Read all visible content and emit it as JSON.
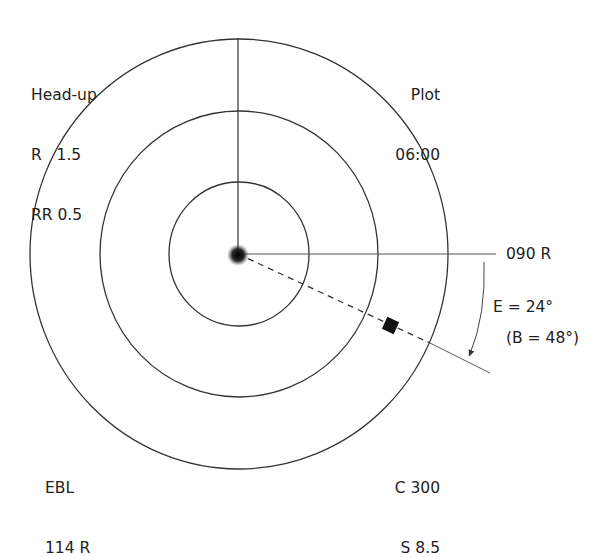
{
  "diagram": {
    "type": "radar-display",
    "mode": {
      "orientation": "Head-up",
      "range_label": "R   1.5",
      "range_rings_label": "RR 0.5"
    },
    "plot": {
      "title": "Plot",
      "time": "06:00"
    },
    "ebl": {
      "title": "EBL",
      "value": "114 R"
    },
    "own_ship": {
      "course": "C 300",
      "speed": "S 8.5"
    },
    "bearing_reference": {
      "label": "090 R"
    },
    "angle_annotation": {
      "error": "E = 24°",
      "bearing": "(B = 48°)"
    },
    "rings": 3,
    "colors": {
      "line": "#333333",
      "target": "#111111",
      "background": "#ffffff"
    }
  }
}
